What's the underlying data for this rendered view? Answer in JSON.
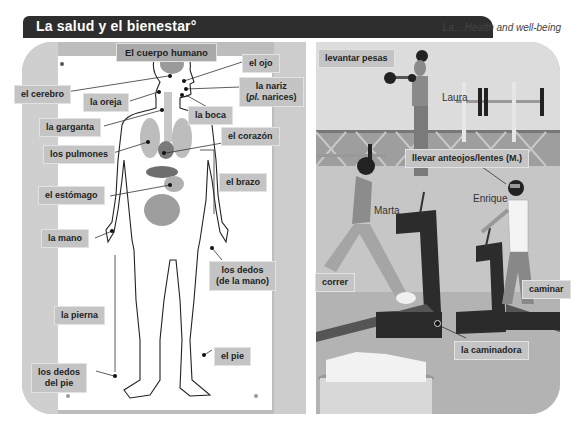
{
  "header": {
    "title": "La salud y el bienestar°",
    "subtitle_plain": "La... ",
    "subtitle_italic": "Health and well-being"
  },
  "body_diagram": {
    "heading": "El cuerpo humano",
    "labels": {
      "brain": "el cerebro",
      "ear": "la oreja",
      "eye": "el ojo",
      "nose_line1": "la nariz",
      "nose_line2_italic": "pl.",
      "nose_line2_rest": " narices)",
      "nose_line2_open": "(",
      "mouth": "la boca",
      "throat": "la garganta",
      "heart": "el corazón",
      "lungs": "los pulmones",
      "stomach": "el estómago",
      "arm": "el brazo",
      "hand": "la mano",
      "fingers_line1": "los dedos",
      "fingers_line2": "(de la mano)",
      "leg": "la pierna",
      "foot": "el pie",
      "toes_line1": "los dedos",
      "toes_line2": "del pie"
    }
  },
  "gym_scene": {
    "labels": {
      "lift_weights": "levantar pesas",
      "wear_glasses": "llevar anteojos/lentes (M.)",
      "run": "correr",
      "walk": "caminar",
      "treadmill": "la caminadora"
    },
    "people": {
      "laura": "Laura",
      "marta": "Marta",
      "enrique": "Enrique"
    }
  }
}
